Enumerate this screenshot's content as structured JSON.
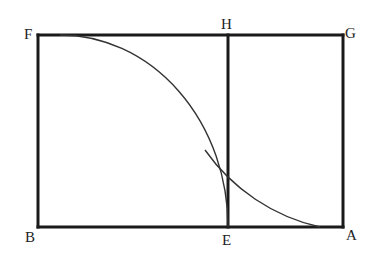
{
  "diagram": {
    "type": "geometric-construction",
    "points": [
      {
        "name": "F",
        "label": "F"
      },
      {
        "name": "H",
        "label": "H"
      },
      {
        "name": "G",
        "label": "G"
      },
      {
        "name": "B",
        "label": "B"
      },
      {
        "name": "E",
        "label": "E"
      },
      {
        "name": "A",
        "label": "A"
      }
    ],
    "segments": [
      "FG",
      "GA",
      "AB",
      "BF",
      "HE"
    ],
    "arcs": [
      "F to E",
      "H-E crossing to A"
    ],
    "colors": {
      "line": "#1a1a1a",
      "arc": "#333333",
      "background": "#ffffff"
    }
  }
}
